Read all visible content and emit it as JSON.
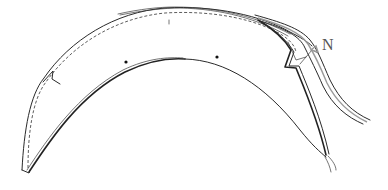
{
  "figure": {
    "type": "line-drawing",
    "labels": [
      {
        "id": "N",
        "text": "N"
      }
    ],
    "colors": {
      "stroke": "#2a2a2a",
      "label": "#555555",
      "background": "#ffffff"
    },
    "markers": [
      {
        "name": "left-dot"
      },
      {
        "name": "right-dot"
      }
    ]
  }
}
